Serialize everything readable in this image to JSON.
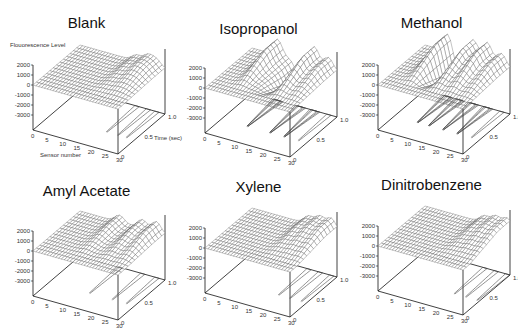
{
  "chart_data": [
    {
      "type": "surface3d",
      "title": "Blank",
      "zlabel": "Flouorescence Level",
      "xlabel": "Sensor number",
      "ylabel": "Time (sec)",
      "z_ticks": [
        "2000",
        "1000",
        "0",
        "-1000",
        "-2000",
        "-3000"
      ],
      "x_ticks": [
        "0",
        "5",
        "10",
        "15",
        "20",
        "25",
        "30"
      ],
      "y_ticks": [
        "0",
        "0.5",
        "1.0"
      ],
      "xlim": [
        0,
        30
      ],
      "ylim": [
        0,
        1.0
      ],
      "zlim": [
        -3000,
        2000
      ],
      "contours_on_base": true,
      "peaks": [
        {
          "sensor": 20,
          "height": 600
        },
        {
          "sensor": 24,
          "height": 900
        },
        {
          "sensor": 27,
          "height": 700
        }
      ]
    },
    {
      "type": "surface3d",
      "title": "Isopropanol",
      "z_ticks": [
        "2000",
        "1000",
        "0",
        "-1000",
        "-2000",
        "-3000"
      ],
      "x_ticks": [
        "0",
        "5",
        "10",
        "15",
        "20",
        "25",
        "30"
      ],
      "y_ticks": [
        "0",
        "0.5",
        "1.0"
      ],
      "xlim": [
        0,
        30
      ],
      "ylim": [
        0,
        1.0
      ],
      "zlim": [
        -3000,
        2000
      ],
      "contours_on_base": true,
      "peaks": [
        {
          "sensor": 9,
          "height": 1600
        },
        {
          "sensor": 17,
          "height": -1600
        },
        {
          "sensor": 22,
          "height": 1900
        },
        {
          "sensor": 27,
          "height": 1200
        }
      ]
    },
    {
      "type": "surface3d",
      "title": "Methanol",
      "z_ticks": [
        "2000",
        "1000",
        "0",
        "-1000",
        "-2000",
        "-3000"
      ],
      "x_ticks": [
        "0",
        "5",
        "10",
        "15",
        "20",
        "25",
        "30"
      ],
      "y_ticks": [
        "0",
        "0.5",
        "1.0"
      ],
      "xlim": [
        0,
        30
      ],
      "ylim": [
        0,
        1.0
      ],
      "zlim": [
        -3000,
        2000
      ],
      "contours_on_base": true,
      "peaks": [
        {
          "sensor": 8,
          "height": 1800
        },
        {
          "sensor": 12,
          "height": -1800
        },
        {
          "sensor": 17,
          "height": 1900
        },
        {
          "sensor": 22,
          "height": 2000
        },
        {
          "sensor": 27,
          "height": 1300
        }
      ]
    },
    {
      "type": "surface3d",
      "title": "Amyl Acetate",
      "z_ticks": [
        "2000",
        "1000",
        "0",
        "-1000",
        "-2000",
        "-3000"
      ],
      "x_ticks": [
        "0",
        "5",
        "10",
        "15",
        "20",
        "25",
        "30"
      ],
      "y_ticks": [
        "0",
        "0.5",
        "1.0"
      ],
      "xlim": [
        0,
        30
      ],
      "ylim": [
        0,
        1.0
      ],
      "zlim": [
        -3000,
        2000
      ],
      "contours_on_base": true,
      "peaks": [
        {
          "sensor": 14,
          "height": 700
        },
        {
          "sensor": 22,
          "height": 900
        },
        {
          "sensor": 27,
          "height": 1100
        }
      ]
    },
    {
      "type": "surface3d",
      "title": "Xylene",
      "z_ticks": [
        "2000",
        "1000",
        "0",
        "-1000",
        "-2000",
        "-3000"
      ],
      "x_ticks": [
        "0",
        "5",
        "10",
        "15",
        "20",
        "25",
        "30"
      ],
      "y_ticks": [
        "0",
        "0.5",
        "1.0"
      ],
      "xlim": [
        0,
        30
      ],
      "ylim": [
        0,
        1.0
      ],
      "zlim": [
        -3000,
        2000
      ],
      "contours_on_base": true,
      "peaks": [
        {
          "sensor": 20,
          "height": 800
        },
        {
          "sensor": 24,
          "height": 1100
        },
        {
          "sensor": 28,
          "height": 1200
        }
      ]
    },
    {
      "type": "surface3d",
      "title": "Dinitrobenzene",
      "z_ticks": [
        "2000",
        "1000",
        "0",
        "-1000",
        "-2000",
        "-3000"
      ],
      "x_ticks": [
        "0",
        "5",
        "10",
        "15",
        "20",
        "25",
        "30"
      ],
      "y_ticks": [
        "0",
        "0.5",
        "1.0"
      ],
      "xlim": [
        0,
        30
      ],
      "ylim": [
        0,
        1.0
      ],
      "zlim": [
        -3000,
        2000
      ],
      "contours_on_base": true,
      "peaks": [
        {
          "sensor": 21,
          "height": 700
        },
        {
          "sensor": 25,
          "height": 1000
        },
        {
          "sensor": 29,
          "height": 1100
        }
      ]
    }
  ],
  "panels": [
    {
      "title": "Blank"
    },
    {
      "title": "Isopropanol"
    },
    {
      "title": "Methanol"
    },
    {
      "title": "Amyl Acetate"
    },
    {
      "title": "Xylene"
    },
    {
      "title": "Dinitrobenzene"
    }
  ],
  "labels": {
    "zlabel": "Flouorescence Level",
    "xlabel": "Sensor number",
    "ylabel": "Time (sec)"
  },
  "z_ticks": [
    "2000",
    "1000",
    "0",
    "-1000",
    "-2000",
    "-3000"
  ],
  "x_ticks": [
    "0",
    "5",
    "10",
    "15",
    "20",
    "25",
    "30"
  ],
  "y_ticks": [
    "0",
    "0.5",
    "1.0"
  ]
}
